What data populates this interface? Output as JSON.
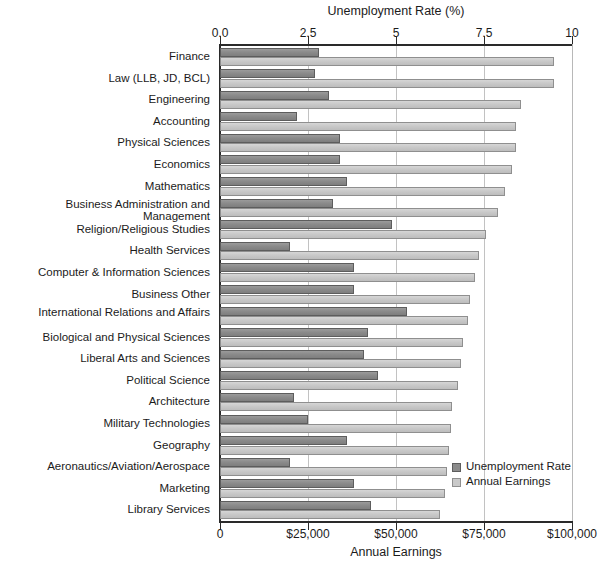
{
  "chart_data": {
    "type": "bar",
    "orientation": "horizontal",
    "title": "",
    "grid": true,
    "legend_position": "inside-bottom-right",
    "top_axis": {
      "label": "Unemployment Rate (%)",
      "ticks": [
        "0.0",
        "2.5",
        "5",
        "7.5",
        "10"
      ],
      "tick_values": [
        0,
        2.5,
        5,
        7.5,
        10
      ],
      "lim": [
        0,
        10
      ]
    },
    "bottom_axis": {
      "label": "Annual Earnings",
      "ticks": [
        "0",
        "$25,000",
        "$50,000",
        "$75,000",
        "$100,000"
      ],
      "tick_values": [
        0,
        25000,
        50000,
        75000,
        100000
      ],
      "lim": [
        0,
        100000
      ]
    },
    "categories": [
      "Finance",
      "Law (LLB, JD, BCL)",
      "Engineering",
      "Accounting",
      "Physical Sciences",
      "Economics",
      "Mathematics",
      "Business Administration and Management",
      "Religion/Religious Studies",
      "Health Services",
      "Computer & Information Sciences",
      "Business Other",
      "International Relations and Affairs",
      "Biological and Physical Sciences",
      "Liberal Arts and Sciences",
      "Political Science",
      "Architecture",
      "Military Technologies",
      "Geography",
      "Aeronautics/Aviation/Aerospace",
      "Marketing",
      "Library Services"
    ],
    "series": [
      {
        "name": "Unemployment Rate",
        "unit": "%",
        "color": "#8b8b8b",
        "axis": "top",
        "values": [
          2.8,
          2.7,
          3.1,
          2.2,
          3.4,
          3.4,
          3.6,
          3.2,
          4.9,
          2.0,
          3.8,
          3.8,
          5.3,
          4.2,
          4.1,
          4.5,
          2.1,
          2.5,
          3.6,
          2.0,
          3.8,
          4.3
        ]
      },
      {
        "name": "Annual Earnings",
        "unit": "$",
        "color": "#c9c9c9",
        "axis": "bottom",
        "values": [
          95000,
          95000,
          85500,
          84000,
          84000,
          83000,
          81000,
          79000,
          75500,
          73500,
          72500,
          71000,
          70500,
          69000,
          68500,
          67500,
          66000,
          65500,
          65000,
          64500,
          64000,
          62500
        ]
      }
    ],
    "legend": [
      {
        "label": "Unemployment Rate",
        "color": "#8b8b8b"
      },
      {
        "label": "Annual Earnings",
        "color": "#c9c9c9"
      }
    ]
  },
  "source_note": ""
}
